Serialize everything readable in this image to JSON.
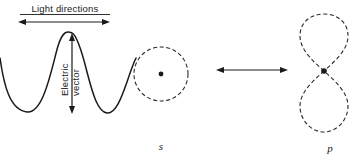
{
  "figure": {
    "title_label": "Light  directions",
    "vector_label_line1": "Electric",
    "vector_label_line2": "vector",
    "orbital_s_label": "s",
    "orbital_p_label": "p",
    "colors": {
      "ink": "#1a1a1a",
      "dashed": "#2a2a2a",
      "background": "#ffffff"
    }
  },
  "diagram_data": {
    "type": "diagram",
    "subject": "Polarized light interacting with s and p atomic orbitals",
    "elements": [
      {
        "name": "light-directions-arrow",
        "kind": "double-headed-arrow",
        "orientation": "horizontal",
        "x1": 18,
        "y1": 22,
        "x2": 110,
        "y2": 22
      },
      {
        "name": "electric-vector-arrow",
        "kind": "double-headed-arrow",
        "orientation": "vertical",
        "x1": 72,
        "y1": 34,
        "x2": 72,
        "y2": 113
      },
      {
        "name": "sine-wave",
        "kind": "wave",
        "description": "transverse electromagnetic wave travelling left to right",
        "crest_y": 33,
        "trough_y": 113,
        "axis_y": 73,
        "x_start": 0,
        "x_end": 135
      },
      {
        "name": "s-orbital",
        "kind": "dashed-circle",
        "cx": 161,
        "cy": 74,
        "r": 27
      },
      {
        "name": "s-orbital-nucleus",
        "kind": "dot",
        "cx": 161,
        "cy": 74,
        "r": 2.4
      },
      {
        "name": "transition-arrow",
        "kind": "double-headed-arrow",
        "orientation": "horizontal",
        "x1": 216,
        "y1": 70,
        "x2": 288,
        "y2": 70
      },
      {
        "name": "p-orbital-upper-lobe",
        "kind": "dashed-teardrop",
        "node_x": 324,
        "node_y": 71,
        "tip_y": 14,
        "half_width": 24
      },
      {
        "name": "p-orbital-lower-lobe",
        "kind": "dashed-teardrop",
        "node_x": 324,
        "node_y": 71,
        "tip_y": 132,
        "half_width": 24
      },
      {
        "name": "p-orbital-nucleus",
        "kind": "dot",
        "cx": 324,
        "cy": 71,
        "r": 2.8
      }
    ]
  }
}
